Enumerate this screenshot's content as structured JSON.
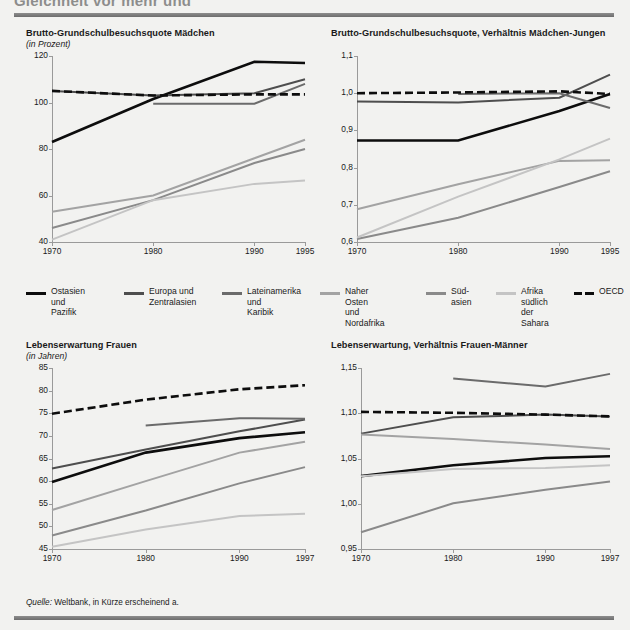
{
  "header": {
    "clipped_title": "Gleichheit vor mehr und"
  },
  "source": {
    "prefix": "Quelle:",
    "text": " Weltbank, in Kürze erscheinend a."
  },
  "legend": {
    "items": [
      {
        "label": "Ostasien\nund Pazifik",
        "color": "#0d0d0d",
        "style": "solid",
        "key": "east_asia_pacific"
      },
      {
        "label": "Europa und\nZentralasien",
        "color": "#4e4e4e",
        "style": "solid",
        "key": "europe_central_asia"
      },
      {
        "label": "Lateinamerika\nund\nKaribik",
        "color": "#6b6b6b",
        "style": "solid",
        "key": "latin_america_caribbean"
      },
      {
        "label": "Naher Osten\nund Nordafrika",
        "color": "#a3a3a3",
        "style": "solid",
        "key": "middle_east_north_africa"
      },
      {
        "label": "Süd-\nasien",
        "color": "#8a8a8a",
        "style": "solid",
        "key": "south_asia"
      },
      {
        "label": "Afrika\nsüdlich der\nSahara",
        "color": "#c4c4c4",
        "style": "solid",
        "key": "sub_saharan_africa"
      },
      {
        "label": "OECD",
        "color": "#0d0d0d",
        "style": "dashed",
        "key": "oecd"
      }
    ]
  },
  "chart_data": [
    {
      "id": "panel-1",
      "type": "line",
      "title": "Brutto-Grundschulbesuchsquote Mädchen",
      "subtitle": "(in Prozent)",
      "xlabel": "",
      "ylabel": "",
      "x": [
        1970,
        1980,
        1990,
        1995
      ],
      "xticklabels": [
        "1970",
        "1980",
        "1990",
        "1995"
      ],
      "yticks": [
        40,
        60,
        80,
        100,
        120
      ],
      "yticklabels": [
        "40",
        "60",
        "80",
        "100",
        "120"
      ],
      "ylim": [
        40,
        120
      ],
      "grid": false,
      "series": [
        {
          "name": "Ostasien und Pazifik",
          "color": "#0d0d0d",
          "style": "solid",
          "width": 2.6,
          "values": [
            83,
            101.5,
            117.5,
            117
          ]
        },
        {
          "name": "Europa und Zentralasien",
          "color": "#4e4e4e",
          "style": "solid",
          "width": 2.0,
          "values": [
            105,
            103,
            104,
            110
          ]
        },
        {
          "name": "Lateinamerika und Karibik",
          "color": "#6b6b6b",
          "style": "solid",
          "width": 2.0,
          "values": [
            null,
            99.5,
            99.5,
            108
          ]
        },
        {
          "name": "Naher Osten und Nordafrika",
          "color": "#a3a3a3",
          "style": "solid",
          "width": 2.0,
          "values": [
            53,
            60,
            76,
            84
          ]
        },
        {
          "name": "Südasien",
          "color": "#8a8a8a",
          "style": "solid",
          "width": 2.0,
          "values": [
            46,
            58,
            74,
            80
          ]
        },
        {
          "name": "Afrika südlich der Sahara",
          "color": "#c4c4c4",
          "style": "solid",
          "width": 2.0,
          "values": [
            41,
            58,
            65,
            66.5
          ]
        },
        {
          "name": "OECD",
          "color": "#0d0d0d",
          "style": "dashed",
          "width": 2.6,
          "values": [
            105,
            103,
            103.5,
            103.5
          ]
        }
      ]
    },
    {
      "id": "panel-2",
      "type": "line",
      "title": "Brutto-Grundschulbesuchsquote, Verhältnis Mädchen-Jungen",
      "subtitle": "",
      "xlabel": "",
      "ylabel": "",
      "x": [
        1970,
        1980,
        1990,
        1995
      ],
      "xticklabels": [
        "1970",
        "1980",
        "1990",
        "1995"
      ],
      "yticks": [
        0.6,
        0.7,
        0.8,
        0.9,
        1.0,
        1.1
      ],
      "yticklabels": [
        "0,6",
        "0,7",
        "0,8",
        "0,9",
        "1,0",
        "1,1"
      ],
      "ylim": [
        0.6,
        1.1
      ],
      "grid": false,
      "series": [
        {
          "name": "Ostasien und Pazifik",
          "color": "#0d0d0d",
          "style": "solid",
          "width": 2.6,
          "values": [
            0.873,
            0.873,
            0.952,
            0.998
          ]
        },
        {
          "name": "Europa und Zentralasien",
          "color": "#4e4e4e",
          "style": "solid",
          "width": 2.0,
          "values": [
            0.978,
            0.975,
            0.988,
            1.05
          ]
        },
        {
          "name": "Lateinamerika und Karibik",
          "color": "#6b6b6b",
          "style": "solid",
          "width": 2.0,
          "values": [
            null,
            0.998,
            1.0,
            0.96
          ]
        },
        {
          "name": "Naher Osten und Nordafrika",
          "color": "#a3a3a3",
          "style": "solid",
          "width": 2.0,
          "values": [
            0.688,
            0.755,
            0.818,
            0.82
          ]
        },
        {
          "name": "Südasien",
          "color": "#8a8a8a",
          "style": "solid",
          "width": 2.0,
          "values": [
            0.608,
            0.665,
            0.748,
            0.79
          ]
        },
        {
          "name": "Afrika südlich der Sahara",
          "color": "#c4c4c4",
          "style": "solid",
          "width": 2.0,
          "values": [
            0.612,
            0.722,
            0.822,
            0.878
          ]
        },
        {
          "name": "OECD",
          "color": "#0d0d0d",
          "style": "dashed",
          "width": 2.6,
          "values": [
            1.0,
            1.002,
            1.005,
            0.998
          ]
        }
      ]
    },
    {
      "id": "panel-3",
      "type": "line",
      "title": "Lebenserwartung Frauen",
      "subtitle": "(in Jahren)",
      "xlabel": "",
      "ylabel": "",
      "x": [
        1970,
        1980,
        1990,
        1997
      ],
      "xticklabels": [
        "1970",
        "1980",
        "1990",
        "1997"
      ],
      "yticks": [
        45,
        50,
        55,
        60,
        65,
        70,
        75,
        80,
        85
      ],
      "yticklabels": [
        "45",
        "50",
        "55",
        "60",
        "65",
        "70",
        "75",
        "80",
        "85"
      ],
      "ylim": [
        45,
        85
      ],
      "grid": false,
      "series": [
        {
          "name": "Ostasien und Pazifik",
          "color": "#0d0d0d",
          "style": "solid",
          "width": 2.6,
          "values": [
            59.8,
            66.3,
            69.5,
            70.8
          ]
        },
        {
          "name": "Europa und Zentralasien",
          "color": "#4e4e4e",
          "style": "solid",
          "width": 2.0,
          "values": [
            62.8,
            67.0,
            71.0,
            73.6
          ]
        },
        {
          "name": "Lateinamerika und Karibik",
          "color": "#6b6b6b",
          "style": "solid",
          "width": 2.0,
          "values": [
            null,
            72.3,
            73.9,
            73.8
          ]
        },
        {
          "name": "Naher Osten und Nordafrika",
          "color": "#a3a3a3",
          "style": "solid",
          "width": 2.0,
          "values": [
            53.6,
            60.0,
            66.3,
            68.7
          ]
        },
        {
          "name": "Südasien",
          "color": "#8a8a8a",
          "style": "solid",
          "width": 2.0,
          "values": [
            48.0,
            53.5,
            59.5,
            63.1
          ]
        },
        {
          "name": "Afrika südlich der Sahara",
          "color": "#c4c4c4",
          "style": "solid",
          "width": 2.0,
          "values": [
            45.5,
            49.3,
            52.3,
            52.8
          ]
        },
        {
          "name": "OECD",
          "color": "#0d0d0d",
          "style": "dashed",
          "width": 2.6,
          "values": [
            74.9,
            78.0,
            80.3,
            81.2
          ]
        }
      ]
    },
    {
      "id": "panel-4",
      "type": "line",
      "title": "Lebenserwartung, Verhältnis Frauen-Männer",
      "subtitle": "",
      "xlabel": "",
      "ylabel": "",
      "x": [
        1970,
        1980,
        1990,
        1997
      ],
      "xticklabels": [
        "1970",
        "1980",
        "1990",
        "1997"
      ],
      "yticks": [
        0.95,
        1.0,
        1.05,
        1.1,
        1.15
      ],
      "yticklabels": [
        "0,95",
        "1,00",
        "1,05",
        "1,10",
        "1,15"
      ],
      "ylim": [
        0.95,
        1.15
      ],
      "grid": false,
      "series": [
        {
          "name": "Ostasien und Pazifik",
          "color": "#0d0d0d",
          "style": "solid",
          "width": 2.6,
          "values": [
            1.0305,
            1.0425,
            1.0505,
            1.0525
          ]
        },
        {
          "name": "Europa und Zentralasien",
          "color": "#4e4e4e",
          "style": "solid",
          "width": 2.0,
          "values": [
            1.0775,
            1.0955,
            1.0985,
            1.0965
          ]
        },
        {
          "name": "Lateinamerika und Karibik",
          "color": "#6b6b6b",
          "style": "solid",
          "width": 2.0,
          "values": [
            null,
            1.1385,
            1.1295,
            1.1435
          ]
        },
        {
          "name": "Naher Osten und Nordafrika",
          "color": "#a3a3a3",
          "style": "solid",
          "width": 2.0,
          "values": [
            1.0765,
            1.0715,
            1.0655,
            1.0605
          ]
        },
        {
          "name": "Südasien",
          "color": "#8a8a8a",
          "style": "solid",
          "width": 2.0,
          "values": [
            0.9685,
            1.0005,
            1.0155,
            1.0245
          ]
        },
        {
          "name": "Afrika südlich der Sahara",
          "color": "#c4c4c4",
          "style": "solid",
          "width": 2.0,
          "values": [
            1.0305,
            1.0385,
            1.0395,
            1.0425
          ]
        },
        {
          "name": "OECD",
          "color": "#0d0d0d",
          "style": "dashed",
          "width": 2.6,
          "values": [
            1.1015,
            1.1005,
            1.0985,
            1.0965
          ]
        }
      ]
    }
  ]
}
